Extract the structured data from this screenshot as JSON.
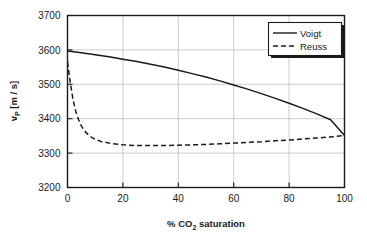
{
  "chart_data": {
    "type": "line",
    "title": "",
    "xlabel": "% CO2 saturation",
    "xlabel_main": "% CO",
    "xlabel_sub": "2",
    "xlabel_tail": " saturation",
    "ylabel": "vP [m / s]",
    "ylabel_main": "v",
    "ylabel_sub": "P",
    "ylabel_tail": " [m / s]",
    "xlim": [
      0,
      100
    ],
    "ylim": [
      3200,
      3700
    ],
    "xticks": [
      "0",
      "20",
      "40",
      "60",
      "80",
      "100"
    ],
    "xtick_values": [
      0,
      20,
      40,
      60,
      80,
      100
    ],
    "yticks": [
      "3200",
      "3300",
      "3400",
      "3500",
      "3600",
      "3700"
    ],
    "ytick_values": [
      3200,
      3300,
      3400,
      3500,
      3600,
      3700
    ],
    "grid": true,
    "legend_position": "top-right",
    "series": [
      {
        "name": "Voigt",
        "style": "solid",
        "color": "#1a1a1a",
        "x": [
          0,
          5,
          10,
          15,
          20,
          25,
          30,
          35,
          40,
          45,
          50,
          55,
          60,
          65,
          70,
          75,
          80,
          85,
          90,
          95,
          100
        ],
        "values": [
          3597,
          3592,
          3586,
          3580,
          3573,
          3566,
          3558,
          3550,
          3541,
          3531,
          3521,
          3510,
          3498,
          3486,
          3473,
          3459,
          3445,
          3430,
          3414,
          3397,
          3351
        ]
      },
      {
        "name": "Reuss",
        "style": "dashed",
        "color": "#1a1a1a",
        "x": [
          0,
          1,
          2,
          3,
          4,
          5,
          6,
          8,
          10,
          12,
          15,
          20,
          25,
          30,
          35,
          40,
          45,
          50,
          55,
          60,
          65,
          70,
          75,
          80,
          85,
          90,
          95,
          100
        ],
        "values": [
          3565,
          3505,
          3455,
          3421,
          3397,
          3379,
          3366,
          3349,
          3340,
          3334,
          3329,
          3324,
          3322,
          3322,
          3322,
          3323,
          3324,
          3325,
          3327,
          3329,
          3331,
          3333,
          3336,
          3338,
          3341,
          3344,
          3347,
          3351
        ]
      }
    ],
    "legend": [
      {
        "label": "Voigt",
        "style": "solid"
      },
      {
        "label": "Reuss",
        "style": "dashed"
      }
    ]
  }
}
